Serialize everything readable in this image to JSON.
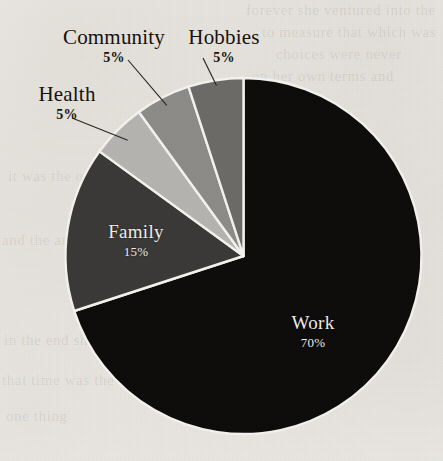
{
  "background": {
    "paper_color": "#f2f0ec",
    "ghost_lines": [
      "forever she ventured into the",
      "to measure that which was",
      "choices were never",
      "on her own terms and",
      "it was the only way",
      "and the answer came",
      "in the end she knew",
      "that time was the",
      "one thing"
    ]
  },
  "chart_data": {
    "type": "pie",
    "title": "",
    "categories": [
      "Work",
      "Family",
      "Health",
      "Community",
      "Hobbies"
    ],
    "values": [
      70,
      15,
      5,
      5,
      5
    ],
    "value_unit": "%",
    "start_angle_deg": 0,
    "direction": "clockwise",
    "legend": "none",
    "label_style": "category-with-percent",
    "slice_colors": [
      "#0e0d0c",
      "#3b3a38",
      "#b6b4b0",
      "#8e8c88",
      "#6d6b67"
    ],
    "slice_border_color": "#f4f2ee",
    "labels": [
      {
        "category": "Work",
        "percent": "70%",
        "placement": "inside",
        "text_color": "#f0eee9"
      },
      {
        "category": "Family",
        "percent": "15%",
        "placement": "inside",
        "text_color": "#f0eee9"
      },
      {
        "category": "Health",
        "percent": "5%",
        "placement": "outside",
        "text_color": "#15120f",
        "leader_line": true
      },
      {
        "category": "Community",
        "percent": "5%",
        "placement": "outside",
        "text_color": "#15120f",
        "leader_line": true
      },
      {
        "category": "Hobbies",
        "percent": "5%",
        "placement": "outside",
        "text_color": "#15120f",
        "leader_line": true
      }
    ]
  }
}
